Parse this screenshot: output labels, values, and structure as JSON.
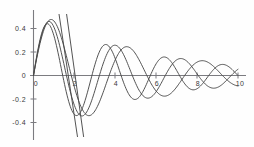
{
  "chart_data": {
    "type": "line",
    "title": "",
    "subtitle": "",
    "xlabel": "",
    "ylabel": "",
    "xlim": [
      -0.35,
      10.4
    ],
    "ylim": [
      -0.5,
      0.52
    ],
    "grid": false,
    "legend": "none",
    "x_ticks": [
      0,
      2,
      4,
      6,
      8,
      10
    ],
    "x_tick_labels": [
      "0",
      "2",
      "4",
      "6",
      "8",
      "10"
    ],
    "y_ticks": [
      -0.4,
      -0.2,
      0,
      0.2,
      0.4
    ],
    "y_tick_labels": [
      "-0.4",
      "-0.2",
      "0",
      "0.2",
      "0.4"
    ],
    "series": [
      {
        "name": "damped-sine-1",
        "form": "exp(-0.18*x)*0.56*sin(1.70*x)",
        "amplitude0": 0.56,
        "decay": 0.18,
        "frequency": 1.7,
        "phase": 0.0,
        "x": [
          0,
          0.25,
          0.5,
          0.75,
          1,
          1.25,
          1.5,
          1.75,
          2,
          2.25,
          2.5,
          2.75,
          3,
          3.25,
          3.5,
          3.75,
          4,
          4.25,
          4.5,
          4.75,
          5,
          5.25,
          5.5,
          5.75,
          6,
          6.25,
          6.5,
          6.75,
          7,
          7.25,
          7.5,
          7.75,
          8,
          8.25,
          8.5,
          8.75,
          9,
          9.25,
          9.5,
          9.75,
          10
        ],
        "values": [
          0,
          0.2,
          0.38,
          0.47,
          0.47,
          0.37,
          0.2,
          0.0,
          -0.19,
          -0.33,
          -0.39,
          -0.37,
          -0.27,
          -0.12,
          0.05,
          0.2,
          0.3,
          0.33,
          0.29,
          0.18,
          0.04,
          -0.11,
          -0.23,
          -0.29,
          -0.28,
          -0.21,
          -0.09,
          0.04,
          0.16,
          0.24,
          0.26,
          0.22,
          0.13,
          0.01,
          -0.11,
          -0.19,
          -0.23,
          -0.21,
          -0.15,
          -0.05,
          0.06
        ]
      },
      {
        "name": "damped-sine-2",
        "form": "exp(-0.18*x)*0.53*sin(1.95*x)",
        "amplitude0": 0.53,
        "decay": 0.18,
        "frequency": 1.95,
        "phase": 0.0,
        "x": [
          0,
          0.25,
          0.5,
          0.75,
          1,
          1.25,
          1.5,
          1.75,
          2,
          2.25,
          2.5,
          2.75,
          3,
          3.25,
          3.5,
          3.75,
          4,
          4.25,
          4.5,
          4.75,
          5,
          5.25,
          5.5,
          5.75,
          6,
          6.25,
          6.5,
          6.75,
          7,
          7.25,
          7.5,
          7.75,
          8,
          8.25,
          8.5,
          8.75,
          9,
          9.25,
          9.5,
          9.75,
          10
        ],
        "values": [
          0,
          0.24,
          0.42,
          0.48,
          0.42,
          0.25,
          0.02,
          -0.2,
          -0.35,
          -0.4,
          -0.33,
          -0.18,
          0.02,
          0.19,
          0.3,
          0.31,
          0.23,
          0.08,
          -0.09,
          -0.22,
          -0.27,
          -0.24,
          -0.14,
          0.01,
          0.14,
          0.22,
          0.23,
          0.16,
          0.04,
          -0.09,
          -0.18,
          -0.21,
          -0.17,
          -0.07,
          0.04,
          0.14,
          0.19,
          0.17,
          0.09,
          -0.01,
          -0.1
        ]
      },
      {
        "name": "damped-sine-3",
        "form": "exp(-0.18*x)*0.50*sin(2.20*x)",
        "amplitude0": 0.5,
        "decay": 0.18,
        "frequency": 2.2,
        "phase": 0.0,
        "x": [
          0,
          0.25,
          0.5,
          0.75,
          1,
          1.25,
          1.5,
          1.75,
          2,
          2.25,
          2.5,
          2.75,
          3,
          3.25,
          3.5,
          3.75,
          4,
          4.25,
          4.5,
          4.75,
          5,
          5.25,
          5.5,
          5.75,
          6,
          6.25,
          6.5,
          6.75,
          7,
          7.25,
          7.5,
          7.75,
          8,
          8.25,
          8.5,
          8.75,
          9,
          9.25,
          9.5,
          9.75,
          10
        ],
        "values": [
          0,
          0.25,
          0.43,
          0.46,
          0.34,
          0.12,
          -0.12,
          -0.31,
          -0.39,
          -0.33,
          -0.16,
          0.05,
          0.23,
          0.31,
          0.27,
          0.13,
          -0.06,
          -0.2,
          -0.26,
          -0.22,
          -0.09,
          0.06,
          0.18,
          0.23,
          0.18,
          0.06,
          -0.08,
          -0.18,
          -0.2,
          -0.14,
          -0.02,
          0.1,
          0.17,
          0.17,
          0.1,
          -0.01,
          -0.11,
          -0.16,
          -0.15,
          -0.07,
          0.04
        ]
      },
      {
        "name": "steep-line-1",
        "form": "near-vertical descending line",
        "x": [
          1.25,
          2.15
        ],
        "values": [
          0.52,
          -0.52
        ]
      },
      {
        "name": "steep-line-2",
        "form": "near-vertical descending line",
        "x": [
          1.62,
          2.45
        ],
        "values": [
          0.52,
          -0.52
        ]
      }
    ]
  },
  "axes": {
    "x_axis_name": "horizontal-axis",
    "y_axis_name": "vertical-axis",
    "origin_label": "0"
  }
}
